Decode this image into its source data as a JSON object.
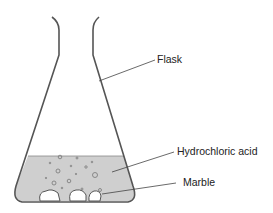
{
  "diagram": {
    "labels": {
      "flask": "Flask",
      "acid": "Hydrochloric acid",
      "marble": "Marble"
    },
    "colors": {
      "outline": "#555555",
      "liquid": "#cfcfcf",
      "leader": "#444444"
    }
  }
}
